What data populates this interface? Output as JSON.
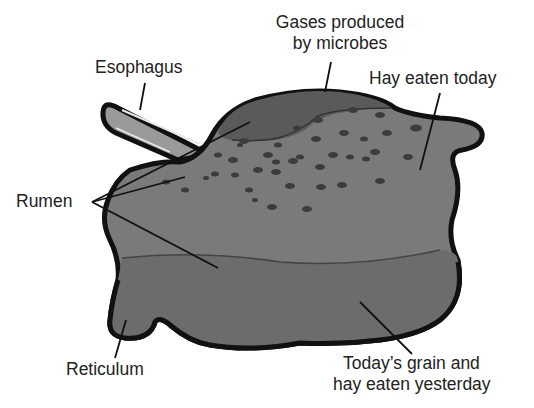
{
  "diagram": {
    "labels": {
      "gases": [
        "Gases produced",
        "by microbes"
      ],
      "esophagus": "Esophagus",
      "hay_today": "Hay eaten today",
      "rumen": "Rumen",
      "reticulum": "Reticulum",
      "grain": [
        "Today’s grain and",
        "hay eaten yesterday"
      ]
    },
    "colors": {
      "outline": "#111111",
      "rumen_fill": "#7a7a7a",
      "gas_fill": "#5a5a5a",
      "lower_layer_fill": "#6c6c6c",
      "esophagus_fill": "#9a9a9a",
      "particles": "#3c3c3c",
      "text": "#222222"
    }
  }
}
